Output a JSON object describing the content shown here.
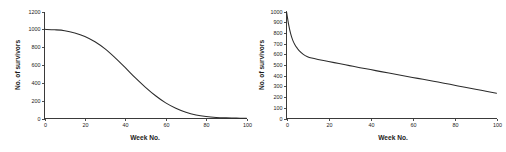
{
  "figure": {
    "name": "survivorship-curves-figure",
    "background_color": "#ffffff",
    "curve_color": "#2b2b2b",
    "axis_color": "#3a3a3a",
    "panel_count": 2
  },
  "chart_data": [
    {
      "type": "line",
      "panel": "left",
      "title": "",
      "xlabel": "Week No.",
      "ylabel": "No. of survivors",
      "xlim": [
        0,
        100
      ],
      "ylim": [
        0,
        1200
      ],
      "xticks": [
        0,
        20,
        40,
        60,
        80,
        100
      ],
      "xtick_labels": [
        "0",
        "20",
        "40",
        "60",
        "80",
        "100"
      ],
      "yticks": [
        0,
        200,
        400,
        600,
        800,
        1000,
        1200
      ],
      "ytick_labels": [
        "0",
        "200",
        "400",
        "600",
        "800",
        "1000",
        "1200"
      ],
      "grid": false,
      "legend": null,
      "series": [
        {
          "name": "Type I survivorship (sigmoid decline)",
          "x": [
            0,
            5,
            10,
            15,
            20,
            25,
            30,
            35,
            40,
            45,
            50,
            55,
            60,
            65,
            70,
            75,
            80,
            85,
            90,
            95,
            100
          ],
          "y": [
            1000,
            995,
            985,
            960,
            920,
            860,
            780,
            680,
            570,
            455,
            350,
            255,
            175,
            115,
            70,
            40,
            22,
            12,
            7,
            4,
            3
          ]
        }
      ],
      "annotations": []
    },
    {
      "type": "line",
      "panel": "right",
      "title": "",
      "xlabel": "Week No.",
      "ylabel": "No. of survivors",
      "xlim": [
        0,
        100
      ],
      "ylim": [
        0,
        1000
      ],
      "xticks": [
        0,
        20,
        40,
        60,
        80,
        100
      ],
      "xtick_labels": [
        "0",
        "20",
        "40",
        "60",
        "80",
        "100"
      ],
      "yticks": [
        0,
        100,
        200,
        300,
        400,
        500,
        600,
        700,
        800,
        900,
        1000
      ],
      "ytick_labels": [
        "0",
        "100",
        "200",
        "300",
        "400",
        "500",
        "600",
        "700",
        "800",
        "900",
        "1000"
      ],
      "grid": false,
      "legend": null,
      "series": [
        {
          "name": "Type III survivorship (steep early loss)",
          "x": [
            0,
            1,
            2,
            3,
            4,
            5,
            6,
            8,
            10,
            12,
            15,
            20,
            25,
            30,
            35,
            40,
            45,
            50,
            55,
            60,
            65,
            70,
            75,
            80,
            85,
            90,
            95,
            100
          ],
          "y": [
            1000,
            880,
            790,
            730,
            690,
            660,
            635,
            600,
            578,
            565,
            552,
            533,
            513,
            494,
            475,
            457,
            438,
            420,
            402,
            384,
            366,
            348,
            330,
            311,
            292,
            274,
            255,
            236
          ]
        }
      ],
      "annotations": []
    }
  ]
}
